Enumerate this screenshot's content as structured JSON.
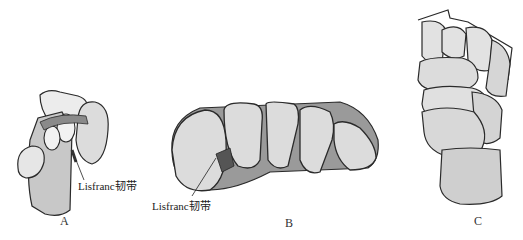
{
  "figure": {
    "panels": [
      {
        "id": "A",
        "label": "A",
        "callout": "Lisfranc韧带"
      },
      {
        "id": "B",
        "label": "B",
        "callout": "Lisfranc韧带"
      },
      {
        "id": "C",
        "label": "C"
      }
    ],
    "colors": {
      "bone_fill": "#d6d6d6",
      "bone_light": "#ececec",
      "outline": "#2a2a2a",
      "ligament": "#555555"
    }
  }
}
